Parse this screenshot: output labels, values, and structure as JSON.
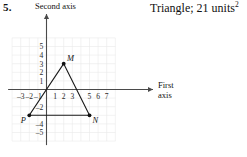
{
  "problem": {
    "number": "5.",
    "answer": "Triangle; 21 units",
    "answer_exponent": "2"
  },
  "axes": {
    "vertical_caption": "Second axis",
    "horizontal_caption_line1": "First",
    "horizontal_caption_line2": "axis"
  },
  "chart_data": {
    "type": "scatter",
    "title": "",
    "subtitle": "",
    "xlabel": "First axis",
    "ylabel": "Second axis",
    "grid": true,
    "legend": "none",
    "xlim": [
      -4,
      8
    ],
    "ylim": [
      -6,
      6
    ],
    "xticks": [
      -3,
      -2,
      -1,
      1,
      2,
      3,
      5,
      6,
      7
    ],
    "xtick_labels": [
      "-3",
      "-2",
      "-1",
      "1",
      "2",
      "3",
      "5",
      "6",
      "7"
    ],
    "yticks": [
      5,
      4,
      3,
      2,
      1,
      -2,
      -4,
      -5
    ],
    "ytick_labels": [
      "5",
      "4",
      "3",
      "2",
      "1",
      "-2",
      "-4",
      "-5"
    ],
    "points": [
      {
        "name": "M",
        "x": 2,
        "y": 3,
        "label": "M",
        "label_position": "upper-right"
      },
      {
        "name": "N",
        "x": 5,
        "y": -3,
        "label": "N",
        "label_position": "lower-right"
      },
      {
        "name": "P",
        "x": -2,
        "y": -3,
        "label": "P",
        "label_position": "lower-left"
      }
    ],
    "shape": {
      "kind": "triangle",
      "vertices": [
        "M",
        "N",
        "P"
      ],
      "area": 21,
      "area_units": "units^2"
    },
    "annotations": [
      {
        "text": "Triangle; 21 units^2",
        "position": "top-right"
      }
    ],
    "colors": {
      "grid": "#e9e9e9",
      "axis": "#4a4a4a",
      "shape_stroke": "#1a1a1a",
      "vertex_fill": "#111111",
      "text": "#111111"
    }
  }
}
